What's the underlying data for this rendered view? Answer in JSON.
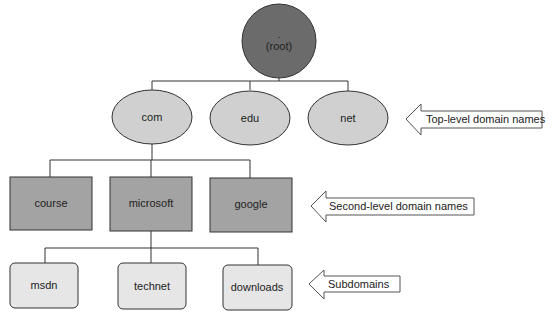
{
  "diagram": {
    "root": {
      "dot": ".",
      "label": "(root)",
      "color": "#6b6b6b"
    },
    "top_level": {
      "nodes": [
        "com",
        "edu",
        "net"
      ],
      "color": "#d0d0d0",
      "annotation": "Top-level domain names"
    },
    "second_level": {
      "parent": "com",
      "nodes": [
        "course",
        "microsoft",
        "google"
      ],
      "color": "#a3a3a3",
      "annotation": "Second-level domain names"
    },
    "subdomains": {
      "parent": "microsoft",
      "nodes": [
        "msdn",
        "technet",
        "downloads"
      ],
      "color": "#e6e6e6",
      "annotation": "Subdomains"
    }
  }
}
